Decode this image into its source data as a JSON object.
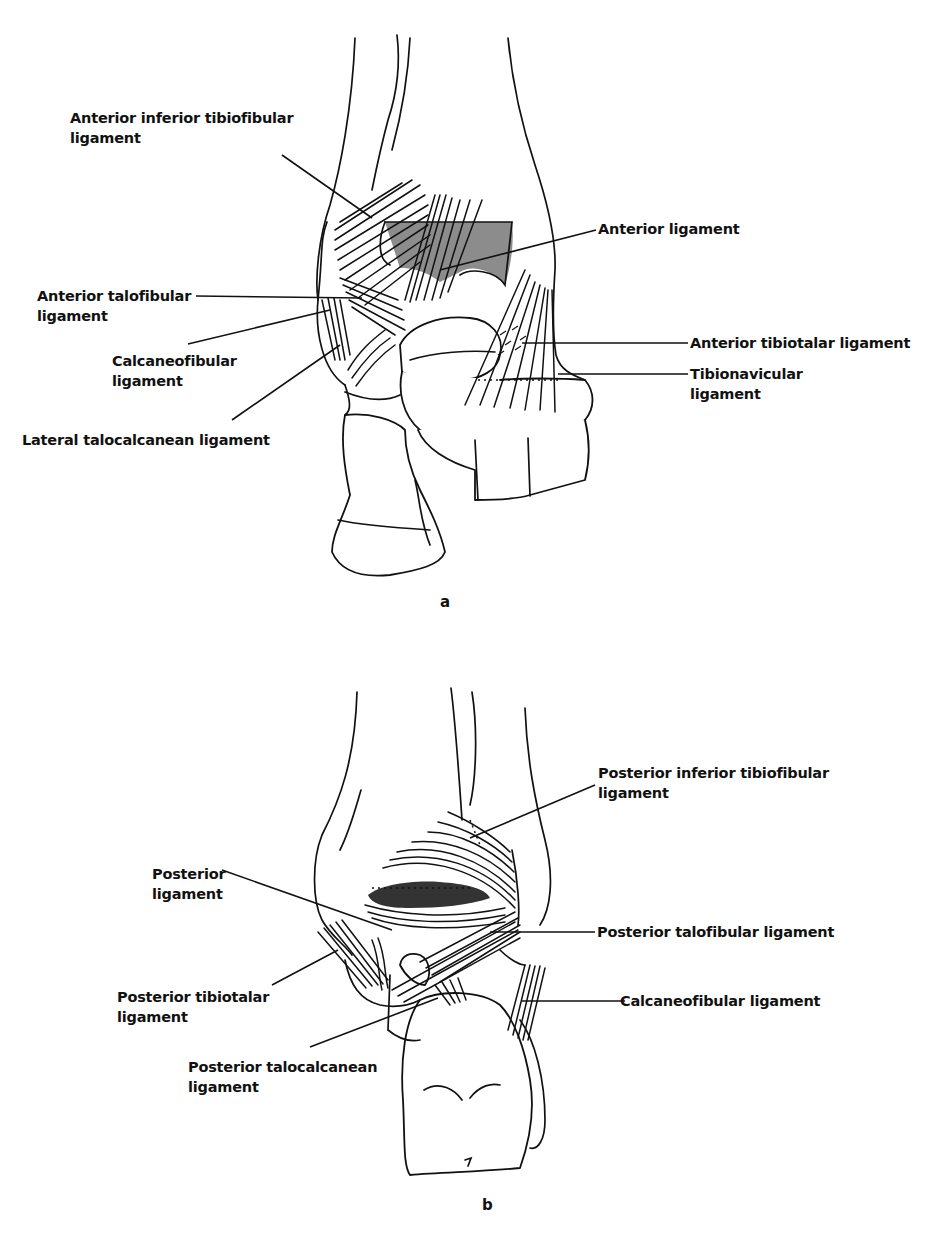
{
  "figure_a": {
    "caption": "a",
    "view": "anterior",
    "labels": [
      {
        "id": "ant-inf-tibiofibular",
        "line1": "Anterior inferior tibiofibular",
        "line2": "ligament"
      },
      {
        "id": "ant-talofibular",
        "line1": "Anterior talofibular",
        "line2": "ligament"
      },
      {
        "id": "calcaneofibular",
        "line1": "Calcaneofibular",
        "line2": "ligament"
      },
      {
        "id": "lat-talocalcanean",
        "line1": "Lateral talocalcanean ligament",
        "line2": ""
      },
      {
        "id": "anterior",
        "line1": "Anterior ligament",
        "line2": ""
      },
      {
        "id": "ant-tibiotalar",
        "line1": "Anterior tibiotalar ligament",
        "line2": ""
      },
      {
        "id": "tibionavicular",
        "line1": "Tibionavicular",
        "line2": "ligament"
      }
    ]
  },
  "figure_b": {
    "caption": "b",
    "view": "posterior",
    "labels": [
      {
        "id": "post-inf-tibiofibular",
        "line1": "Posterior inferior tibiofibular",
        "line2": "ligament"
      },
      {
        "id": "posterior",
        "line1": "Posterior",
        "line2": "ligament"
      },
      {
        "id": "post-talofibular",
        "line1": "Posterior talofibular ligament",
        "line2": ""
      },
      {
        "id": "post-tibiotalar",
        "line1": "Posterior tibiotalar",
        "line2": "ligament"
      },
      {
        "id": "calcaneofibular",
        "line1": "Calcaneofibular ligament",
        "line2": ""
      },
      {
        "id": "post-talocalcanean",
        "line1": "Posterior talocalcanean",
        "line2": "ligament"
      }
    ]
  }
}
